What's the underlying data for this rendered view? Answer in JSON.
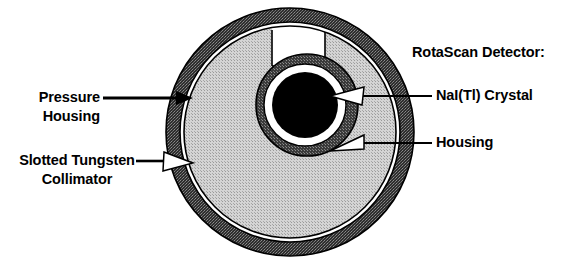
{
  "figure": {
    "type": "cross-section-diagram"
  },
  "labels": {
    "pressure_housing": {
      "line1": "Pressure",
      "line2": "Housing",
      "arrow": "solid-black-arrow-right"
    },
    "slotted_collimator": {
      "line1": "Slotted Tungsten",
      "line2": "Collimator",
      "arrow": "hollow-white-arrow-right"
    },
    "rotascan_heading": "RotaScan Detector:",
    "nai_crystal": {
      "text": "NaI(Tl) Crystal",
      "arrow": "hollow-white-arrow-left"
    },
    "housing": {
      "text": "Housing",
      "arrow": "hollow-white-arrow-left"
    }
  },
  "geometry": {
    "center_x": 290,
    "center_y": 132,
    "pressure_housing_outer_radius": 124,
    "pressure_housing_inner_radius": 110,
    "collimator_outer_radius": 106,
    "detector_center_x": 307,
    "detector_center_y": 105,
    "detector_housing_outer_radius": 51,
    "detector_gap_outer_radius": 41,
    "crystal_radius": 33,
    "slot_left": 272,
    "slot_right": 325,
    "slot_top": 26,
    "slot_bottom": 66
  },
  "colors": {
    "background": "#ffffff",
    "pressure_housing_fill": "#4a4a4a",
    "collimator_fill": "#c8c8c8",
    "detector_housing_fill": "#505050",
    "crystal_fill": "#000000",
    "gap_fill": "#ffffff",
    "outline": "#000000",
    "text": "#000000"
  }
}
